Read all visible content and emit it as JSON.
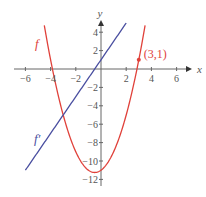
{
  "chart_data": {
    "type": "line",
    "title": "",
    "xlabel": "x",
    "ylabel": "y",
    "xlim": [
      -6.5,
      6.5
    ],
    "ylim": [
      -12.5,
      5
    ],
    "x_ticks": [
      -6,
      -4,
      -2,
      2,
      4,
      6
    ],
    "y_ticks": [
      4,
      2,
      -2,
      -4,
      -6,
      -8,
      -10,
      -12
    ],
    "grid": false,
    "series": [
      {
        "name": "f",
        "label": "f",
        "expression": "x^2 + x - 11",
        "domain": [
          -4.5,
          3.5
        ],
        "color": "#e0413a"
      },
      {
        "name": "f'",
        "label": "f′",
        "expression": "2x + 1",
        "domain": [
          -6,
          2
        ],
        "color": "#4a4fa0"
      }
    ],
    "annotations": [
      {
        "type": "point",
        "x": 3,
        "y": 1,
        "label": "(3,1)",
        "color": "#e0413a"
      }
    ]
  },
  "colors": {
    "axis": "#666666",
    "f": "#e0413a",
    "fprime": "#4a4fa0"
  }
}
